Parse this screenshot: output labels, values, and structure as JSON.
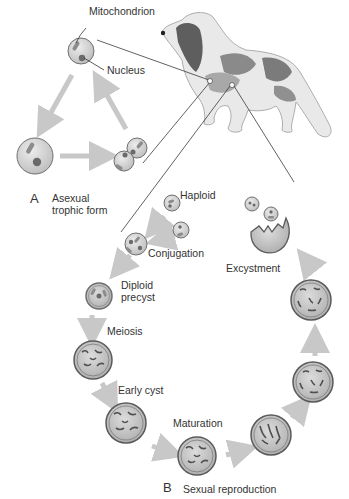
{
  "panel_a": {
    "letter": "A",
    "title_line1": "Asexual",
    "title_line2": "trophic form",
    "labels": {
      "mitochondrion": "Mitochondrion",
      "nucleus": "Nucleus"
    }
  },
  "panel_b": {
    "letter": "B",
    "title": "Sexual reproduction",
    "stages": {
      "haploid": "Haploid",
      "conjugation": "Conjugation",
      "diploid_line1": "Diploid",
      "diploid_line2": "precyst",
      "meiosis": "Meiosis",
      "early_cyst": "Early cyst",
      "maturation": "Maturation",
      "excystment": "Excystment"
    }
  },
  "host": {
    "name": "dog"
  },
  "colors": {
    "cell_fill": "#cfcfcf",
    "cell_stroke": "#6f6f6f",
    "arrow": "#c8c8c8",
    "line": "#3a3a3a",
    "text": "#333333"
  }
}
